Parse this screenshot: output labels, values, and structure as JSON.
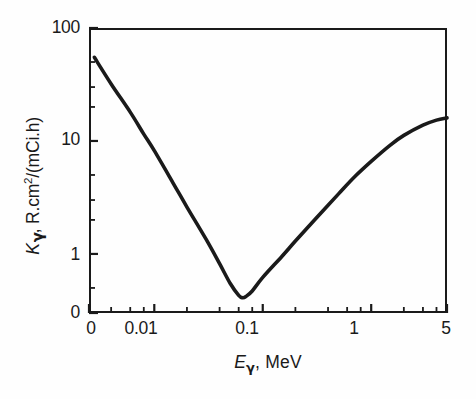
{
  "chart_data": {
    "type": "line",
    "title": "",
    "xlabel": "E γ, MeV",
    "ylabel": "K γ, R.cm2/(mCi.h)",
    "xscale": "log",
    "yscale": "log",
    "xlim": [
      0.0025,
      5
    ],
    "ylim": [
      0.3,
      100
    ],
    "grid": false,
    "legend": null,
    "x_tick_labels": [
      "0",
      "0.01",
      "0.1",
      "1",
      "5"
    ],
    "x_tick_values": [
      0.0025,
      0.01,
      0.1,
      1,
      5
    ],
    "y_tick_labels": [
      "100",
      "10",
      "1",
      "0"
    ],
    "y_tick_values": [
      100,
      10,
      1,
      0.3
    ],
    "x_minor_ticks": [
      0.004,
      0.006,
      0.008,
      0.02,
      0.04,
      0.06,
      0.08,
      0.2,
      0.4,
      0.6,
      0.8,
      2,
      3,
      4
    ],
    "y_minor_ticks": [
      50,
      30,
      20,
      5,
      3,
      2,
      0.5
    ],
    "series": [
      {
        "name": "K gamma",
        "x": [
          0.0028,
          0.004,
          0.006,
          0.008,
          0.01,
          0.015,
          0.02,
          0.03,
          0.04,
          0.05,
          0.06,
          0.065,
          0.07,
          0.08,
          0.1,
          0.15,
          0.2,
          0.3,
          0.5,
          0.7,
          1.0,
          1.5,
          2.0,
          3.0,
          4.0,
          5.0
        ],
        "y": [
          55.0,
          32.0,
          18.0,
          11.5,
          8.2,
          4.2,
          2.6,
          1.35,
          0.82,
          0.55,
          0.43,
          0.41,
          0.42,
          0.47,
          0.62,
          0.95,
          1.3,
          2.0,
          3.4,
          4.8,
          6.6,
          9.2,
          11.2,
          13.8,
          15.3,
          16.0
        ]
      }
    ]
  },
  "axes": {
    "y_title_parts": {
      "symbol": "K",
      "sub": "γ",
      "rest": ", R.cm",
      "exp": "2",
      "tail": "/(mCi.h)"
    },
    "x_title_parts": {
      "symbol": "E",
      "sub": "γ",
      "rest": ", MeV"
    }
  },
  "style": {
    "curve_color": "#1a1a1a",
    "axis_color": "#1a1a1a",
    "background": "#fefefe",
    "text_color": "#1a1a1a"
  }
}
